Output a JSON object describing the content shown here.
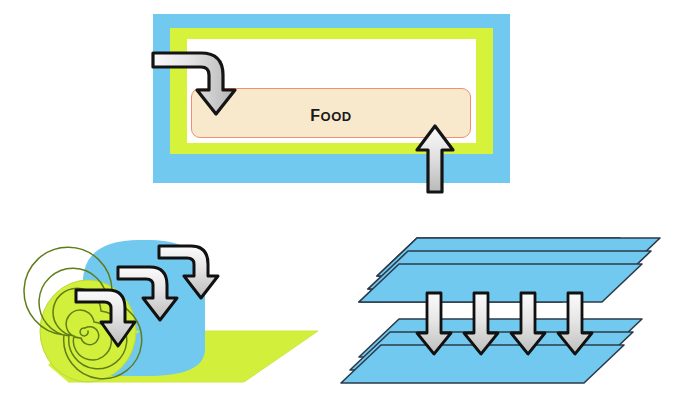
{
  "figure": {
    "title": "",
    "background": "#ffffff",
    "width": 677,
    "height": 396
  },
  "colors": {
    "sky_blue": "#72c9ef",
    "sky_blue_dark": "#5cbde8",
    "yellow_green": "#d6f23a",
    "yellow_green_roll": "#d2ef3c",
    "white": "#ffffff",
    "food_fill": "#f8e9cd",
    "food_border": "#f09070",
    "arrow_outline": "#1a1a1a",
    "arrow_fill_light": "#f2f2f2",
    "arrow_fill_mid": "#c9c9c9",
    "sheet_edge": "#2b3a4a",
    "spiral_line": "#5f7d18"
  },
  "panels": {
    "cross_section": {
      "name": "package-cross-section",
      "layers": [
        {
          "id": "outer",
          "label": "outer blue layer",
          "color": "#72c9ef"
        },
        {
          "id": "middle",
          "label": "middle yellow-green layer",
          "color": "#d6f23a"
        },
        {
          "id": "headspace",
          "label": "white headspace",
          "color": "#ffffff"
        }
      ],
      "food_box": {
        "label": "Food",
        "fill": "#f8e9cd",
        "border": "#f09070"
      },
      "arrows": [
        {
          "id": "inlet-arrow",
          "label": "bent inlet arrow entering from left then turning down",
          "direction": "left-then-down"
        },
        {
          "id": "outlet-arrow",
          "label": "straight arrow pointing up from below",
          "direction": "up"
        }
      ]
    },
    "roll": {
      "name": "rolled-film-web",
      "parts": [
        {
          "id": "roll-cylinder",
          "label": "blue cylinder body",
          "color": "#72c9ef"
        },
        {
          "id": "roll-end-spiral",
          "label": "spiral wound end face",
          "color": "#d2ef3c"
        },
        {
          "id": "unwound-sheet",
          "label": "unwound yellow-green sheet",
          "color": "#d2ef3c"
        }
      ],
      "arrow_count": 3,
      "arrow_label": "bent arrow turning down onto sheet",
      "arrow_direction": "left-then-down"
    },
    "stack": {
      "name": "stacked-sheets",
      "top_stack_count": 3,
      "bottom_stack_count": 3,
      "sheet_color": "#72c9ef",
      "arrow_count": 4,
      "arrow_label": "downward arrow between sheet stacks",
      "arrow_direction": "down"
    }
  }
}
